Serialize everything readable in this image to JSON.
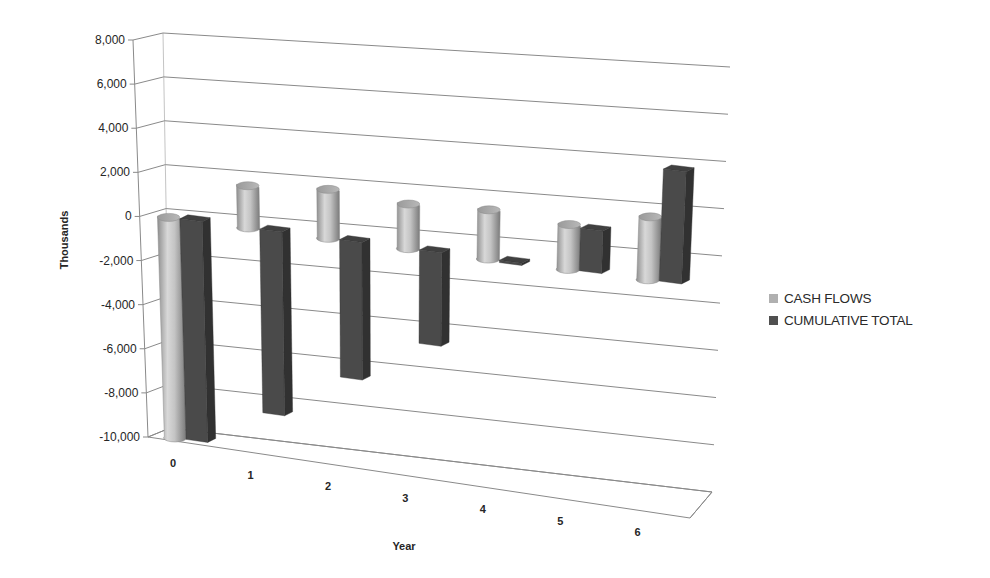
{
  "chart_data": {
    "type": "bar",
    "subtype": "3d-column",
    "title": "",
    "xlabel": "Year",
    "ylabel": "Thousands",
    "categories": [
      "0",
      "1",
      "2",
      "3",
      "4",
      "5",
      "6"
    ],
    "series": [
      {
        "name": "CASH FLOWS",
        "values": [
          -10000,
          1900,
          2200,
          2000,
          2200,
          2000,
          2800
        ],
        "color": "#b5b5b5",
        "shape": "cylinder"
      },
      {
        "name": "CUMULATIVE TOTAL",
        "values": [
          -10000,
          -8300,
          -6200,
          -4200,
          -100,
          1900,
          5000
        ],
        "color": "#4a4a4a",
        "shape": "box"
      }
    ],
    "ylim": [
      -10000,
      8000
    ],
    "yticks": [
      8000,
      6000,
      4000,
      2000,
      0,
      -2000,
      -4000,
      -6000,
      -8000,
      -10000
    ],
    "ytick_labels": [
      "8,000",
      "6,000",
      "4,000",
      "2,000",
      "0",
      "-2,000",
      "-4,000",
      "-6,000",
      "-8,000",
      "-10,000"
    ],
    "grid": true,
    "legend_position": "right"
  },
  "legend": {
    "items": [
      {
        "label": "CASH FLOWS",
        "color": "#b0b0b0"
      },
      {
        "label": "CUMULATIVE TOTAL",
        "color": "#505050"
      }
    ]
  },
  "axes": {
    "x_title": "Year",
    "y_title": "Thousands"
  }
}
